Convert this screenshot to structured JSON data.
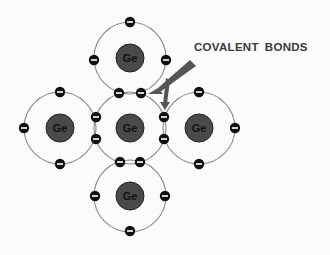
{
  "label": {
    "word1": "COVALENT",
    "word2": "BONDS"
  },
  "atoms": [
    {
      "id": "top",
      "symbol": "Ge"
    },
    {
      "id": "left",
      "symbol": "Ge"
    },
    {
      "id": "center",
      "symbol": "Ge"
    },
    {
      "id": "right",
      "symbol": "Ge"
    },
    {
      "id": "bottom",
      "symbol": "Ge"
    }
  ],
  "electron_symbol": "−",
  "colors": {
    "nucleus": "#4a4a4a",
    "nucleus_stroke": "#222222",
    "electron": "#111111",
    "orbit": "#8a8a8a",
    "arrow": "#555555",
    "text": "#3a3a3a"
  }
}
